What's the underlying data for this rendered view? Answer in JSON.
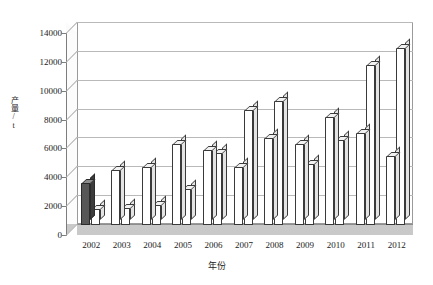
{
  "chart_data": {
    "type": "bar",
    "title": "",
    "xlabel": "年份",
    "ylabel": "产量/t",
    "categories": [
      "2002",
      "2003",
      "2004",
      "2005",
      "2006",
      "2007",
      "2008",
      "2009",
      "2010",
      "2011",
      "2012"
    ],
    "series": [
      {
        "name": "series-1",
        "values": [
          2900,
          3800,
          4000,
          5600,
          5200,
          4000,
          6000,
          5600,
          7500,
          6400,
          4800
        ]
      },
      {
        "name": "series-2",
        "values": [
          1100,
          1200,
          1400,
          2500,
          5000,
          8000,
          8600,
          4200,
          5900,
          11100,
          12300
        ]
      }
    ],
    "ylim": [
      0,
      14000
    ],
    "ytick_step": 2000,
    "yticks": [
      "0",
      "2000",
      "4000",
      "6000",
      "8000",
      "10000",
      "12000",
      "14000"
    ],
    "grid": true,
    "legend": "none",
    "style": "3d-clustered-column",
    "colors": {
      "series_1_first_bar": "#575757",
      "series_default": "#ffffff",
      "bar_outline": "#3a3a3a",
      "gridline": "#b9b9b9",
      "axis": "#7d7d7d",
      "floor": "#c9c9c9"
    }
  },
  "axis": {
    "y_title": "产量/t",
    "x_title": "年份"
  }
}
